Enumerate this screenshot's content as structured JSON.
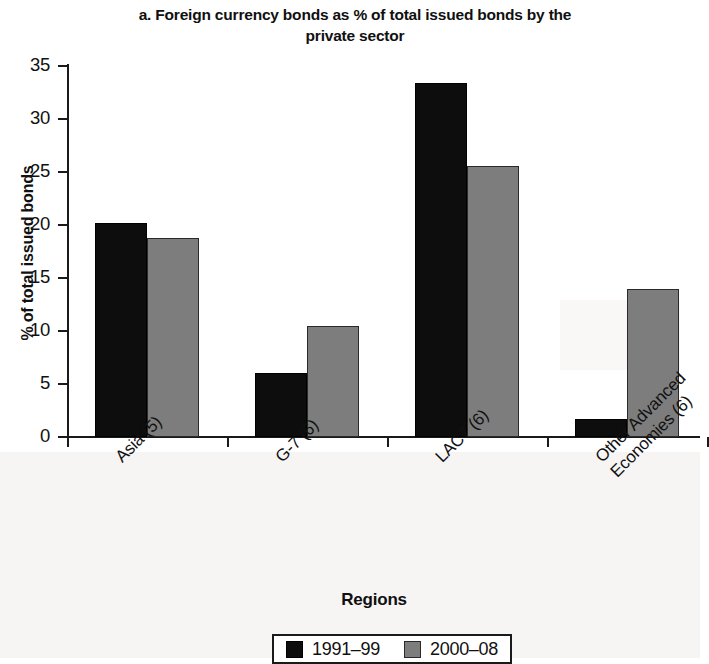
{
  "chart_data": {
    "type": "bar",
    "title": "a. Foreign currency bonds as % of total issued bonds by the private sector",
    "xlabel": "Regions",
    "ylabel": "% of total issued bonds",
    "categories": [
      "Asia (5)",
      "G-7 (6)",
      "LAC7 (6)",
      "Other Advanced Economies (6)"
    ],
    "series": [
      {
        "name": "1991–99",
        "color": "#0d0d0d",
        "values": [
          20.2,
          6.0,
          33.4,
          1.7
        ]
      },
      {
        "name": "2000–08",
        "color": "#7d7d7d",
        "values": [
          18.8,
          10.5,
          25.6,
          14.0
        ]
      }
    ],
    "ylim": [
      0,
      35
    ],
    "yticks": [
      "0",
      "5",
      "10",
      "15",
      "20",
      "25",
      "30",
      "35"
    ],
    "grid": false,
    "legend_position": "bottom"
  },
  "axis": {
    "y_title": "% of total issued bonds",
    "x_title": "Regions"
  },
  "legend": {
    "entries": [
      {
        "label": "1991–99",
        "swatch": "black-square-swatch"
      },
      {
        "label": "2000–08",
        "swatch": "gray-square-swatch"
      }
    ]
  },
  "category_label_lines": [
    [
      "Asia (5)"
    ],
    [
      "G-7 (6)"
    ],
    [
      "LAC7 (6)"
    ],
    [
      "Other Advanced",
      "Economies (6)"
    ]
  ]
}
